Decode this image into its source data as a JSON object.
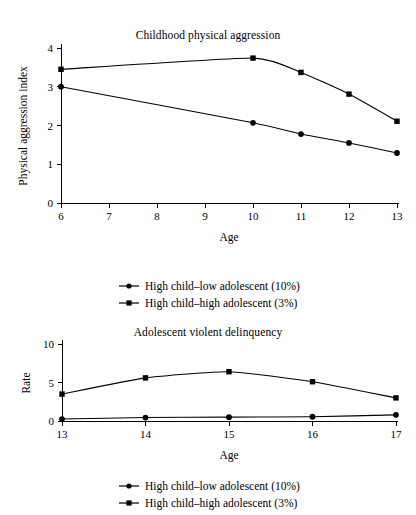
{
  "figure": {
    "series_names": [
      "High child–low adolescent (10%)",
      "High child–high adolescent (3%)"
    ],
    "marker_shapes": [
      "circle",
      "square"
    ],
    "line_color": "#000000"
  },
  "legend_top": {
    "items": [
      {
        "label": "High child–low adolescent (10%)",
        "marker": "circle-marker"
      },
      {
        "label": "High child–high adolescent (3%)",
        "marker": "square-marker"
      }
    ]
  },
  "legend_bottom": {
    "items": [
      {
        "label": "High child–low adolescent (10%)",
        "marker": "circle-marker"
      },
      {
        "label": "High child–high adolescent (3%)",
        "marker": "square-marker"
      }
    ]
  },
  "chart_data": [
    {
      "type": "line",
      "title": "Childhood physical aggression",
      "xlabel": "Age",
      "ylabel": "Physical aggression index",
      "x": [
        6,
        7,
        8,
        9,
        10,
        11,
        12,
        13
      ],
      "xticklabels": [
        "6",
        "7",
        "8",
        "9",
        "10",
        "11",
        "12",
        "13"
      ],
      "yticklabels": [
        "0",
        "1",
        "2",
        "3",
        "4"
      ],
      "xlim": [
        6,
        13
      ],
      "ylim": [
        0,
        4
      ],
      "grid": false,
      "legend_position": "below",
      "series": [
        {
          "name": "High child–low adolescent (10%)",
          "marker": "circle",
          "x": [
            6,
            10,
            11,
            12,
            13
          ],
          "values": [
            3.0,
            2.07,
            1.78,
            1.55,
            1.29
          ]
        },
        {
          "name": "High child–high adolescent (3%)",
          "marker": "square",
          "x": [
            6,
            10,
            11,
            12,
            13
          ],
          "values": [
            3.45,
            3.74,
            3.37,
            2.81,
            2.11
          ]
        }
      ]
    },
    {
      "type": "line",
      "title": "Adolescent violent delinquency",
      "xlabel": "Age",
      "ylabel": "Rate",
      "x": [
        13,
        14,
        15,
        16,
        17
      ],
      "xticklabels": [
        "13",
        "14",
        "15",
        "16",
        "17"
      ],
      "yticklabels": [
        "0",
        "5",
        "10"
      ],
      "xlim": [
        13,
        17
      ],
      "ylim": [
        0,
        10
      ],
      "grid": false,
      "legend_position": "below",
      "series": [
        {
          "name": "High child–low adolescent (10%)",
          "marker": "circle",
          "x": [
            13,
            14,
            15,
            16,
            17
          ],
          "values": [
            0.25,
            0.45,
            0.5,
            0.55,
            0.8
          ]
        },
        {
          "name": "High child–high adolescent (3%)",
          "marker": "square",
          "x": [
            13,
            14,
            15,
            16,
            17
          ],
          "values": [
            3.5,
            5.6,
            6.4,
            5.1,
            3.0
          ]
        }
      ]
    }
  ]
}
